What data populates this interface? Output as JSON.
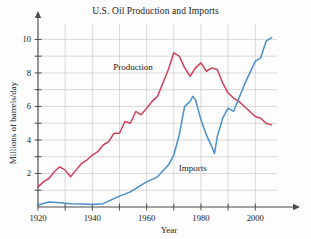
{
  "chart_data": {
    "type": "line",
    "title": "U.S. Oil Production and Imports",
    "xlabel": "Year",
    "ylabel": "Millions of barrels/day",
    "xlim": [
      1920,
      2008
    ],
    "ylim": [
      0,
      10.8
    ],
    "grid": true,
    "legend_position": "inline-annotation",
    "x_ticks_major": [
      1920,
      1940,
      1960,
      1980,
      2000
    ],
    "x_ticks_minor": [
      1930,
      1950,
      1970,
      1990
    ],
    "x_tick_labels": [
      "1920",
      "1940",
      "1960",
      "1980",
      "2000"
    ],
    "y_ticks_major": [
      2,
      4,
      6,
      8,
      10
    ],
    "y_ticks_minor": [
      1,
      3,
      5,
      7,
      9
    ],
    "y_tick_labels": [
      "2",
      "4",
      "6",
      "8",
      "10"
    ],
    "annotations": [
      {
        "text": "Production",
        "x": 1955,
        "y": 8.2
      },
      {
        "text": "Imports",
        "x": 1977,
        "y": 2.15
      }
    ],
    "series": [
      {
        "name": "Production",
        "color": "#d1405a",
        "x": [
          1920,
          1922,
          1924,
          1926,
          1928,
          1930,
          1932,
          1934,
          1936,
          1938,
          1940,
          1942,
          1944,
          1946,
          1948,
          1950,
          1952,
          1954,
          1956,
          1958,
          1960,
          1962,
          1964,
          1966,
          1968,
          1970,
          1972,
          1974,
          1976,
          1978,
          1980,
          1982,
          1984,
          1986,
          1988,
          1990,
          1992,
          1994,
          1996,
          1998,
          2000,
          2002,
          2004,
          2006
        ],
        "y": [
          1.2,
          1.5,
          1.7,
          2.1,
          2.4,
          2.2,
          1.8,
          2.2,
          2.6,
          2.8,
          3.1,
          3.3,
          3.7,
          3.9,
          4.4,
          4.4,
          5.1,
          5.0,
          5.7,
          5.5,
          5.9,
          6.3,
          6.6,
          7.4,
          8.2,
          9.2,
          9.0,
          8.3,
          7.8,
          8.3,
          8.6,
          8.1,
          8.3,
          8.2,
          7.4,
          6.8,
          6.5,
          6.3,
          6.0,
          5.7,
          5.4,
          5.3,
          5.0,
          4.9
        ]
      },
      {
        "name": "Imports",
        "color": "#4a8ecb",
        "x": [
          1920,
          1924,
          1928,
          1932,
          1936,
          1940,
          1944,
          1948,
          1950,
          1954,
          1958,
          1960,
          1964,
          1968,
          1970,
          1972,
          1974,
          1976,
          1977,
          1978,
          1980,
          1982,
          1984,
          1985,
          1986,
          1988,
          1990,
          1992,
          1994,
          1996,
          1998,
          2000,
          2002,
          2004,
          2006
        ],
        "y": [
          0.12,
          0.3,
          0.25,
          0.2,
          0.18,
          0.15,
          0.2,
          0.5,
          0.65,
          0.9,
          1.3,
          1.5,
          1.8,
          2.5,
          3.1,
          4.3,
          6.0,
          6.3,
          6.6,
          6.4,
          5.2,
          4.3,
          3.6,
          3.2,
          4.2,
          5.3,
          5.9,
          5.7,
          6.5,
          7.3,
          8.0,
          8.7,
          8.9,
          9.9,
          10.1
        ]
      }
    ]
  }
}
